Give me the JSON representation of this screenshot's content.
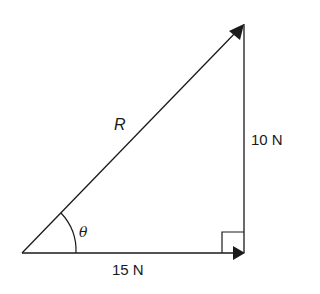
{
  "diagram": {
    "labels": {
      "resultant": "R",
      "vertical": "10 N",
      "horizontal": "15 N",
      "angle": "θ"
    },
    "colors": {
      "line": "#1a1a1a",
      "background": "#ffffff"
    }
  }
}
